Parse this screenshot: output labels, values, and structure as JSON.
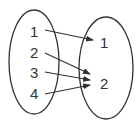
{
  "diagram": {
    "type": "mapping",
    "domain": {
      "elements": [
        "1",
        "2",
        "3",
        "4"
      ]
    },
    "codomain": {
      "elements": [
        "1",
        "2"
      ]
    },
    "arrows": [
      {
        "from": "1",
        "to": "1"
      },
      {
        "from": "2",
        "to": "2"
      },
      {
        "from": "3",
        "to": "2"
      },
      {
        "from": "4",
        "to": "2"
      }
    ],
    "colors": {
      "stroke": "#333333",
      "background": "#ffffff"
    }
  }
}
